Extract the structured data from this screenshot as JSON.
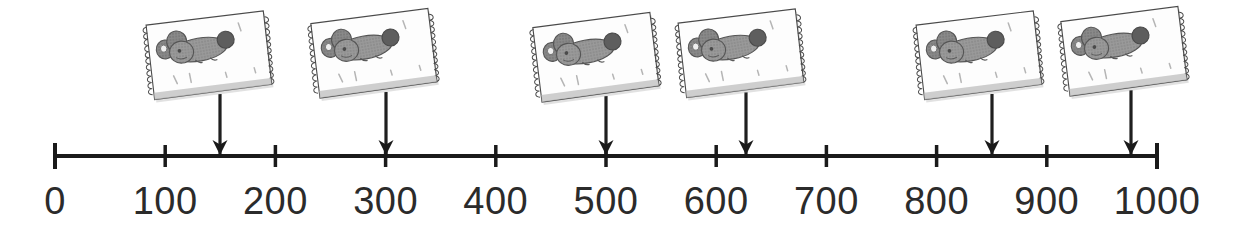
{
  "figure": {
    "type": "number-line-diagram",
    "background_color": "#ffffff",
    "line_color": "#1a1a1a",
    "label_color": "#2b2b2b"
  },
  "number_line": {
    "min": 0,
    "max": 1000,
    "tick_interval": 100,
    "axis_y": 156,
    "pixel_start_x": 55,
    "pixel_end_x": 1157,
    "pixels_per_unit": 1.102,
    "labels": [
      "0",
      "100",
      "200",
      "300",
      "400",
      "500",
      "600",
      "700",
      "800",
      "900",
      "1000"
    ],
    "tick_values": [
      0,
      100,
      200,
      300,
      400,
      500,
      600,
      700,
      800,
      900,
      1000
    ]
  },
  "markers": [
    {
      "id": "marker-1",
      "value": 150,
      "x": 220,
      "arrow": true,
      "card": {
        "x": 140,
        "y": 14,
        "rotate": -5.0
      }
    },
    {
      "id": "marker-2",
      "value": 300,
      "x": 386,
      "arrow": true,
      "card": {
        "x": 305,
        "y": 12,
        "rotate": -5.5
      }
    },
    {
      "id": "marker-3",
      "value": 500,
      "x": 606,
      "arrow": true,
      "card": {
        "x": 527,
        "y": 16,
        "rotate": -5.5
      }
    },
    {
      "id": "marker-4",
      "value": 627,
      "x": 746,
      "arrow": true,
      "card": {
        "x": 672,
        "y": 12,
        "rotate": -5.0
      }
    },
    {
      "id": "marker-5",
      "value": 850,
      "x": 992,
      "arrow": true,
      "card": {
        "x": 910,
        "y": 14,
        "rotate": -5.0
      }
    },
    {
      "id": "marker-6",
      "value": 976,
      "x": 1131,
      "arrow": true,
      "card": {
        "x": 1055,
        "y": 10,
        "rotate": -5.5
      }
    }
  ],
  "card": {
    "icon": "mouse-drawing",
    "width": 132,
    "height": 84,
    "paper_color": "#fdfdfd",
    "border_color": "#4a4a4a",
    "mouse_body_color": "#9a9a9a",
    "mouse_ear_color": "#8a8a8a",
    "mouse_dark_color": "#5e5e5e",
    "edge_style": "torn-perforated",
    "count": 6
  },
  "chart_data": {
    "type": "scatter",
    "title": "",
    "xlabel": "",
    "ylabel": "",
    "xlim": [
      0,
      1000
    ],
    "x_tick_interval": 100,
    "x_ticks": [
      0,
      100,
      200,
      300,
      400,
      500,
      600,
      700,
      800,
      900,
      1000
    ],
    "x_tick_labels": [
      "0",
      "100",
      "200",
      "300",
      "400",
      "500",
      "600",
      "700",
      "800",
      "900",
      "1000"
    ],
    "grid": false,
    "legend": "none",
    "series": [
      {
        "name": "mouse-photo-markers",
        "marker": "down-arrow-with-image-card",
        "values": [
          150,
          300,
          500,
          627,
          850,
          976
        ]
      }
    ],
    "annotations": [
      "Six identical mouse picture cards attached by stems to downward arrows on the number line."
    ]
  }
}
